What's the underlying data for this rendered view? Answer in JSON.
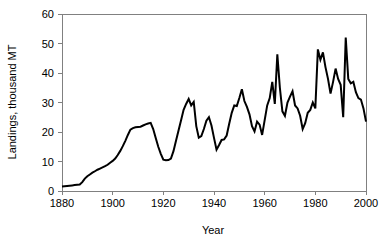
{
  "chart_data": {
    "type": "line",
    "title": "",
    "xlabel": "Year",
    "ylabel": "Landings, thousand MT",
    "xlim": [
      1880,
      2000
    ],
    "ylim": [
      0,
      60
    ],
    "xticks": [
      1880,
      1900,
      1920,
      1940,
      1960,
      1980,
      2000
    ],
    "yticks": [
      0,
      10,
      20,
      30,
      40,
      50,
      60
    ],
    "grid": false,
    "legend": null,
    "series": [
      {
        "name": "Landings",
        "color": "#000000",
        "x": [
          1880,
          1881,
          1882,
          1883,
          1884,
          1885,
          1886,
          1887,
          1888,
          1889,
          1890,
          1891,
          1892,
          1893,
          1894,
          1895,
          1896,
          1897,
          1898,
          1899,
          1900,
          1901,
          1902,
          1903,
          1904,
          1905,
          1906,
          1907,
          1908,
          1909,
          1910,
          1911,
          1912,
          1913,
          1914,
          1915,
          1916,
          1917,
          1918,
          1919,
          1920,
          1921,
          1922,
          1923,
          1924,
          1925,
          1926,
          1927,
          1928,
          1929,
          1930,
          1931,
          1932,
          1933,
          1934,
          1935,
          1936,
          1937,
          1938,
          1939,
          1940,
          1941,
          1942,
          1943,
          1944,
          1945,
          1946,
          1947,
          1948,
          1949,
          1950,
          1951,
          1952,
          1953,
          1954,
          1955,
          1956,
          1957,
          1958,
          1959,
          1960,
          1961,
          1962,
          1963,
          1964,
          1965,
          1966,
          1967,
          1968,
          1969,
          1970,
          1971,
          1972,
          1973,
          1974,
          1975,
          1976,
          1977,
          1978,
          1979,
          1980,
          1981,
          1982,
          1983,
          1984,
          1985,
          1986,
          1987,
          1988,
          1989,
          1990,
          1991,
          1992,
          1993,
          1994,
          1995,
          1996,
          1997,
          1998,
          1999,
          2000
        ],
        "values": [
          1.5,
          1.6,
          1.7,
          1.8,
          1.9,
          2.0,
          2.1,
          2.2,
          3.0,
          4.2,
          5.0,
          5.6,
          6.2,
          6.7,
          7.2,
          7.6,
          8.0,
          8.4,
          8.9,
          9.6,
          10.2,
          11.0,
          12.2,
          13.6,
          15.2,
          17.0,
          19.0,
          20.8,
          21.3,
          21.6,
          21.7,
          21.8,
          22.2,
          22.6,
          22.9,
          23.1,
          21.0,
          18.0,
          15.0,
          12.6,
          10.6,
          10.4,
          10.5,
          11.0,
          13.5,
          17.0,
          20.5,
          24.0,
          27.5,
          29.5,
          31.2,
          29.0,
          30.2,
          22.0,
          18.1,
          18.6,
          21.0,
          23.8,
          25.0,
          22.2,
          18.0,
          14.0,
          15.6,
          17.3,
          17.5,
          18.8,
          22.8,
          26.5,
          29.0,
          28.8,
          31.5,
          34.5,
          30.5,
          28.5,
          26.0,
          22.0,
          20.2,
          23.5,
          22.5,
          19.0,
          24.0,
          29.0,
          31.5,
          37.0,
          29.5,
          46.3,
          35.0,
          27.0,
          25.5,
          30.0,
          32.0,
          33.8,
          29.0,
          28.0,
          25.5,
          21.0,
          23.0,
          26.5,
          27.5,
          30.0,
          28.0,
          48.0,
          44.5,
          47.0,
          42.0,
          38.0,
          33.0,
          37.0,
          41.5,
          38.0,
          36.0,
          25.0,
          52.0,
          38.0,
          36.5,
          37.0,
          33.5,
          31.5,
          31.0,
          28.0,
          23.5
        ]
      }
    ]
  },
  "axis": {
    "y_tick_labels": [
      "0",
      "10",
      "20",
      "30",
      "40",
      "50",
      "60"
    ],
    "x_tick_labels": [
      "1880",
      "1900",
      "1920",
      "1940",
      "1960",
      "1980",
      "2000"
    ],
    "x_axis_title": "Year",
    "y_axis_title": "Landings, thousand MT"
  },
  "colors": {
    "line": "#000000",
    "axis": "#808080",
    "background": "#ffffff",
    "text": "#000000"
  }
}
